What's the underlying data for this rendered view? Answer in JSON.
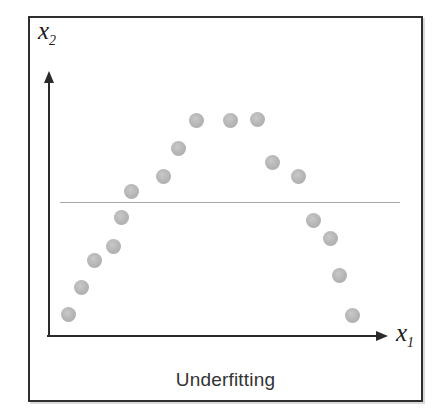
{
  "figure": {
    "caption": "Underfitting",
    "y_axis_label": "x",
    "y_axis_sub": "2",
    "x_axis_label": "x",
    "x_axis_sub": "1",
    "colors": {
      "border": "#2f2f2f",
      "axis": "#2a2a2a",
      "fit_line": "#9a9a9a",
      "dot": "#b4b4b4",
      "text": "#333333"
    }
  },
  "chart_data": {
    "type": "scatter",
    "title": "Underfitting",
    "xlabel": "x1",
    "ylabel": "x2",
    "grid": false,
    "legend": false,
    "axis_ticks": "none",
    "dot_diameter_px": 15,
    "series": [
      {
        "name": "data-points",
        "marker": "filled-circle-gray",
        "points_px": [
          [
            68,
            314
          ],
          [
            81,
            287
          ],
          [
            94,
            260
          ],
          [
            113,
            246
          ],
          [
            121,
            217
          ],
          [
            131,
            191
          ],
          [
            163,
            176
          ],
          [
            178,
            148
          ],
          [
            196,
            120
          ],
          [
            230,
            120
          ],
          [
            257,
            119
          ],
          [
            272,
            162
          ],
          [
            298,
            176
          ],
          [
            313,
            220
          ],
          [
            330,
            238
          ],
          [
            339,
            275
          ],
          [
            352,
            315
          ]
        ]
      }
    ],
    "fit_line": {
      "shape": "horizontal",
      "y_px": 202,
      "x_start_px": 60,
      "x_end_px": 400
    },
    "axes": {
      "origin_px": [
        48,
        335
      ],
      "x_tip_px": 386,
      "y_tip_px": 73
    }
  }
}
